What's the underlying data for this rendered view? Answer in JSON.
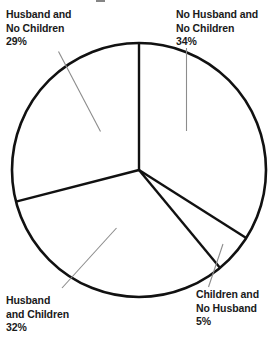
{
  "chart_data": {
    "type": "pie",
    "title": "",
    "subtitle": "",
    "xlabel": "",
    "ylabel": "",
    "legend_position": "none",
    "grid": false,
    "unit": "%",
    "start_angle_deg": 0,
    "direction": "clockwise",
    "center": {
      "x": 139,
      "y": 170
    },
    "radius": 127,
    "categories": [
      "No Husband and No Children",
      "Children and No Husband",
      "Husband and Children",
      "Husband and No Children"
    ],
    "values": [
      34,
      5,
      32,
      29
    ],
    "slices": [
      {
        "name": "no-husband-no-children",
        "label_line_1": "No Husband and",
        "label_line_2": "No Children",
        "value": 34,
        "percent_text": "34%",
        "start_deg": 0,
        "end_deg": 122.4,
        "fill": "#ffffff",
        "stroke": "#111111"
      },
      {
        "name": "children-no-husband",
        "label_line_1": "Children and",
        "label_line_2": "No Husband",
        "value": 5,
        "percent_text": "5%",
        "start_deg": 122.4,
        "end_deg": 140.4,
        "fill": "#ffffff",
        "stroke": "#111111"
      },
      {
        "name": "husband-and-children",
        "label_line_1": "Husband",
        "label_line_2": "and Children",
        "value": 32,
        "percent_text": "32%",
        "start_deg": 140.4,
        "end_deg": 255.6,
        "fill": "#ffffff",
        "stroke": "#111111"
      },
      {
        "name": "husband-no-children",
        "label_line_1": "Husband and",
        "label_line_2": "No Children",
        "value": 29,
        "percent_text": "29%",
        "start_deg": 255.6,
        "end_deg": 360,
        "fill": "#ffffff",
        "stroke": "#111111"
      }
    ]
  },
  "labels": {
    "husband_no_children": {
      "line1": "Husband and",
      "line2": "No Children",
      "percent": "29%"
    },
    "no_husband_no_children": {
      "line1": "No Husband and",
      "line2": "No Children",
      "percent": "34%"
    },
    "husband_and_children": {
      "line1": "Husband",
      "line2": "and Children",
      "percent": "32%"
    },
    "children_no_husband": {
      "line1": "Children and",
      "line2": "No Husband",
      "percent": "5%"
    }
  },
  "style": {
    "background": "#ffffff",
    "pie_stroke": "#111111",
    "pie_fill": "#ffffff",
    "leader_line": "#8c8c8c",
    "text_color": "#1a1a1a"
  }
}
